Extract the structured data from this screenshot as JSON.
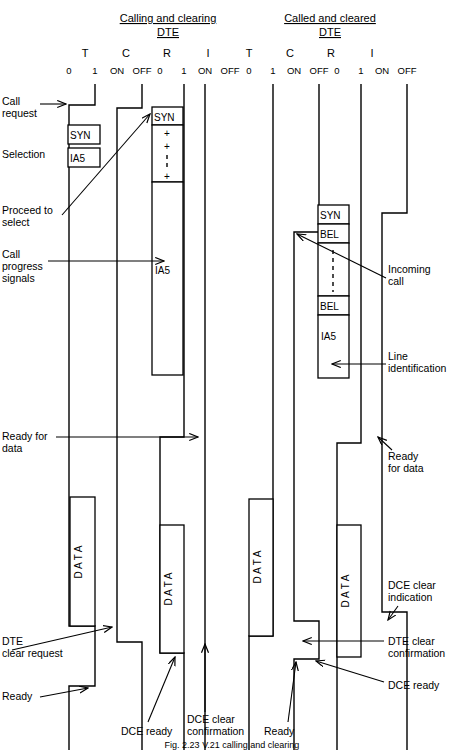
{
  "header": {
    "groups": [
      {
        "title_line1": "Calling and clearing",
        "title_line2": "DTE"
      },
      {
        "title_line1": "Called and cleared",
        "title_line2": "DTE"
      }
    ],
    "signals": [
      "T",
      "C",
      "R",
      "I",
      "T",
      "C",
      "R",
      "I"
    ],
    "levels": [
      "0",
      "1",
      "ON",
      "OFF",
      "0",
      "1",
      "ON",
      "OFF",
      "0",
      "1",
      "ON",
      "OFF",
      "0",
      "1",
      "ON",
      "OFF"
    ]
  },
  "left_labels": [
    {
      "id": "call-request",
      "line1": "Call",
      "line2": "request"
    },
    {
      "id": "selection",
      "line1": "Selection",
      "line2": ""
    },
    {
      "id": "proceed-to-select",
      "line1": "Proceed to",
      "line2": "select"
    },
    {
      "id": "call-progress-signals",
      "line1": "Call",
      "line2": "progress",
      "line3": "signals"
    },
    {
      "id": "ready-for-data",
      "line1": "Ready for",
      "line2": "data"
    },
    {
      "id": "dte-clear-request",
      "line1": "DTE",
      "line2": "clear request"
    },
    {
      "id": "ready-left",
      "line1": "Ready",
      "line2": ""
    }
  ],
  "right_labels": [
    {
      "id": "incoming-call",
      "line1": "Incoming",
      "line2": "call"
    },
    {
      "id": "line-identification",
      "line1": "Line",
      "line2": "identification"
    },
    {
      "id": "ready-for-data-right",
      "line1": "Ready",
      "line2": "for data"
    },
    {
      "id": "dce-clear-indication",
      "line1": "DCE clear",
      "line2": "indication"
    },
    {
      "id": "dte-clear-confirmation",
      "line1": "DTE clear",
      "line2": "confirmation"
    },
    {
      "id": "dce-ready-right",
      "line1": "DCE ready",
      "line2": ""
    }
  ],
  "bottom_labels": [
    {
      "id": "dce-ready-bottom",
      "line1": "DCE ready",
      "line2": ""
    },
    {
      "id": "dce-clear-confirmation-bottom",
      "line1": "DCE clear",
      "line2": "confirmation"
    },
    {
      "id": "ready-bottom",
      "line1": "Ready",
      "line2": ""
    }
  ],
  "blocks": {
    "left_c_syn": "SYN",
    "left_c_ia5": "IA5",
    "left_r_syn": "SYN",
    "left_r_ia5": "IA5",
    "left_r_plus": "+",
    "right_r_syn": "SYN",
    "right_r_bel_top": "BEL",
    "right_r_bel_bottom": "BEL",
    "right_r_ia5": "IA5",
    "data": "D A T A"
  },
  "caption": "Fig. 2.23   V.21 calling and clearing",
  "colors": {
    "ink": "#000000",
    "paper": "#ffffff"
  }
}
